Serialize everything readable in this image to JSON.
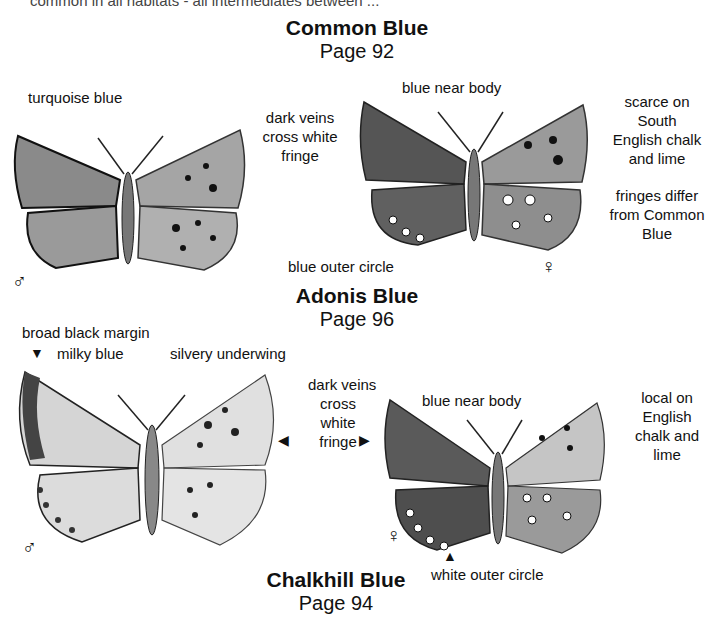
{
  "cut_text": "common in all habitats - all intermediates between ...",
  "sections": [
    {
      "title": "Common Blue",
      "page": "Page 92",
      "male": {
        "sex_symbol": "♂",
        "labels": [
          "turquoise blue",
          "dark veins",
          "cross white",
          "fringe"
        ]
      },
      "female": {
        "sex_symbol": "♀",
        "labels": [
          "blue near body",
          "blue outer circle"
        ]
      },
      "notes": [
        "scarce on",
        "South",
        "English chalk",
        "and lime",
        "fringes differ",
        "from Common",
        "Blue"
      ]
    },
    {
      "title": "Adonis Blue",
      "page": "Page 96",
      "male": {
        "sex_symbol": "♂",
        "labels": [
          "broad black margin",
          "milky blue",
          "silvery underwing"
        ]
      },
      "female": {
        "sex_symbol": "♀",
        "labels": [
          "dark veins",
          "cross",
          "white",
          "fringe",
          "blue near body",
          "white outer circle"
        ]
      },
      "notes": [
        "local on",
        "English",
        "chalk and",
        "lime"
      ]
    },
    {
      "title": "Chalkhill Blue",
      "page": "Page 94"
    }
  ],
  "arrows": {
    "down": "▼",
    "left": "◀",
    "right": "▶",
    "up": "▲"
  },
  "colors": {
    "ink": "#111111",
    "wing_dark": "#6a6a6a",
    "wing_mid": "#9a9a9a",
    "wing_light": "#cfcfcf",
    "paper": "#ffffff"
  }
}
